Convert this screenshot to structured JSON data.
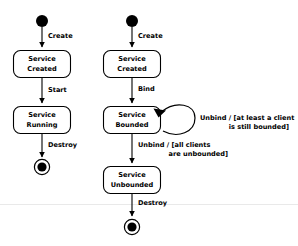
{
  "diagram": {
    "type": "uml-state-diagram",
    "colors": {
      "background": "#ffffff",
      "stroke": "#000000",
      "fill": "#ffffff",
      "faint_rule": "#e9e9e9"
    },
    "columns": [
      {
        "id": "started-service",
        "name": "Started service lifecycle",
        "states": [
          {
            "id": "created",
            "line1": "Service",
            "line2": "Created"
          },
          {
            "id": "running",
            "line1": "Service",
            "line2": "Running"
          }
        ],
        "transitions": [
          {
            "id": "t-create",
            "label": "Create"
          },
          {
            "id": "t-start",
            "label": "Start"
          },
          {
            "id": "t-destroy",
            "label": "Destroy"
          }
        ]
      },
      {
        "id": "bound-service",
        "name": "Bound service lifecycle",
        "states": [
          {
            "id": "created2",
            "line1": "Service",
            "line2": "Created"
          },
          {
            "id": "bounded",
            "line1": "Service",
            "line2": "Bounded"
          },
          {
            "id": "unbounded",
            "line1": "Service",
            "line2": "Unbounded"
          }
        ],
        "transitions": [
          {
            "id": "t-create2",
            "label": "Create"
          },
          {
            "id": "t-bind",
            "label": "Bind"
          },
          {
            "id": "t-unbind-loop",
            "label_line1": "Unbind / [at least a client",
            "label_line2": "is still bounded]"
          },
          {
            "id": "t-unbind-all",
            "label_line1": "Unbind / [all clients",
            "label_line2": "are unbounded]"
          },
          {
            "id": "t-destroy2",
            "label": "Destroy"
          }
        ]
      }
    ]
  }
}
